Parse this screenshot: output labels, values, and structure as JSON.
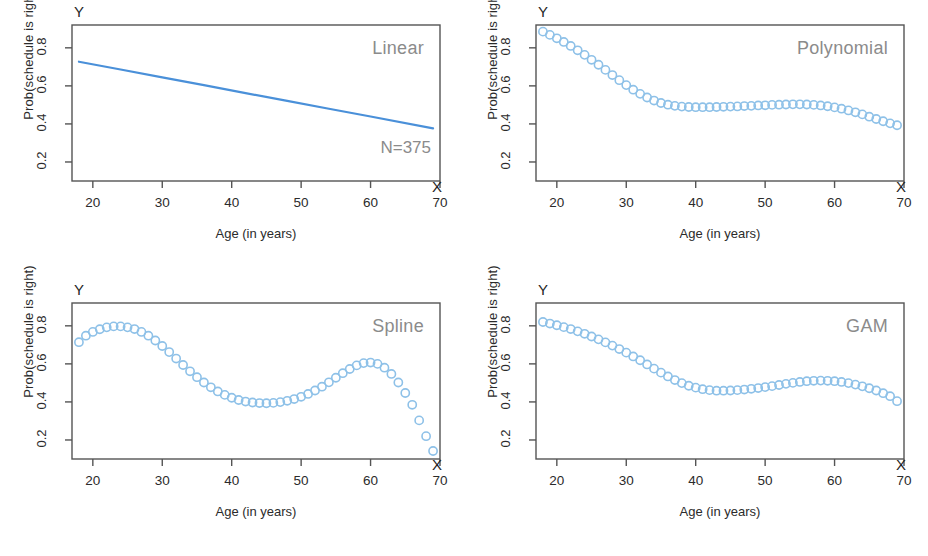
{
  "figure": {
    "background": "#ffffff",
    "marker_color": "#8ec1e8",
    "line_color": "#4a90d9",
    "axis_color": "#545454",
    "title_color": "#8b8b8b",
    "panel_count": 4
  },
  "axes": {
    "y_axis_title": "Prob(schedule is right)",
    "x_axis_title": "Age (in years)",
    "y_ticks": [
      "0.2",
      "0.4",
      "0.6",
      "0.8"
    ],
    "x_ticks": [
      "20",
      "30",
      "40",
      "50",
      "60",
      "70"
    ],
    "y_marker": "Y",
    "x_marker": "X"
  },
  "chart_data": [
    {
      "type": "line",
      "title": "Linear",
      "xlabel": "Age (in years)",
      "ylabel": "Prob(schedule is right)",
      "xlim": [
        17,
        70
      ],
      "ylim": [
        0.1,
        0.92
      ],
      "xticks": [
        20,
        30,
        40,
        50,
        60,
        70
      ],
      "yticks": [
        0.2,
        0.4,
        0.6,
        0.8
      ],
      "grid": false,
      "legend": "none",
      "annotation": "N=375",
      "n": 375,
      "x": [
        18,
        24,
        30,
        36,
        42,
        48,
        54,
        60,
        69
      ],
      "y": [
        0.727,
        0.686,
        0.645,
        0.604,
        0.562,
        0.521,
        0.48,
        0.439,
        0.377
      ]
    },
    {
      "type": "scatter",
      "title": "Polynomial",
      "xlabel": "Age (in years)",
      "ylabel": "Prob(schedule is right)",
      "xlim": [
        17,
        70
      ],
      "ylim": [
        0.1,
        0.92
      ],
      "xticks": [
        20,
        30,
        40,
        50,
        60,
        70
      ],
      "yticks": [
        0.2,
        0.4,
        0.6,
        0.8
      ],
      "grid": false,
      "legend": "none",
      "x": [
        18,
        19,
        20,
        21,
        22,
        23,
        24,
        25,
        26,
        27,
        28,
        29,
        30,
        31,
        32,
        33,
        34,
        35,
        36,
        37,
        38,
        39,
        40,
        41,
        42,
        43,
        44,
        45,
        46,
        47,
        48,
        49,
        50,
        51,
        52,
        53,
        54,
        55,
        56,
        57,
        58,
        59,
        60,
        61,
        62,
        63,
        64,
        65,
        66,
        67,
        68,
        69
      ],
      "y": [
        0.885,
        0.868,
        0.85,
        0.831,
        0.81,
        0.787,
        0.763,
        0.737,
        0.711,
        0.684,
        0.657,
        0.63,
        0.604,
        0.58,
        0.558,
        0.539,
        0.523,
        0.51,
        0.501,
        0.495,
        0.491,
        0.489,
        0.488,
        0.488,
        0.488,
        0.489,
        0.49,
        0.491,
        0.492,
        0.494,
        0.495,
        0.497,
        0.498,
        0.5,
        0.501,
        0.502,
        0.503,
        0.503,
        0.502,
        0.5,
        0.497,
        0.493,
        0.487,
        0.48,
        0.471,
        0.461,
        0.45,
        0.438,
        0.426,
        0.414,
        0.403,
        0.393
      ]
    },
    {
      "type": "scatter",
      "title": "Spline",
      "xlabel": "Age (in years)",
      "ylabel": "Prob(schedule is right)",
      "xlim": [
        17,
        70
      ],
      "ylim": [
        0.1,
        0.92
      ],
      "xticks": [
        20,
        30,
        40,
        50,
        60,
        70
      ],
      "yticks": [
        0.2,
        0.4,
        0.6,
        0.8
      ],
      "grid": false,
      "legend": "none",
      "x": [
        18,
        19,
        20,
        21,
        22,
        23,
        24,
        25,
        26,
        27,
        28,
        29,
        30,
        31,
        32,
        33,
        34,
        35,
        36,
        37,
        38,
        39,
        40,
        41,
        42,
        43,
        44,
        45,
        46,
        47,
        48,
        49,
        50,
        51,
        52,
        53,
        54,
        55,
        56,
        57,
        58,
        59,
        60,
        61,
        62,
        63,
        64,
        65,
        66,
        67,
        68,
        69
      ],
      "y": [
        0.714,
        0.748,
        0.768,
        0.782,
        0.792,
        0.797,
        0.797,
        0.792,
        0.783,
        0.768,
        0.748,
        0.723,
        0.694,
        0.662,
        0.628,
        0.594,
        0.561,
        0.53,
        0.502,
        0.477,
        0.455,
        0.437,
        0.422,
        0.41,
        0.402,
        0.397,
        0.394,
        0.393,
        0.395,
        0.399,
        0.406,
        0.415,
        0.427,
        0.442,
        0.46,
        0.48,
        0.503,
        0.527,
        0.551,
        0.573,
        0.592,
        0.604,
        0.607,
        0.6,
        0.58,
        0.547,
        0.502,
        0.447,
        0.385,
        0.303,
        0.22,
        0.142
      ]
    },
    {
      "type": "scatter",
      "title": "GAM",
      "xlabel": "Age (in years)",
      "ylabel": "Prob(schedule is right)",
      "xlim": [
        17,
        70
      ],
      "ylim": [
        0.1,
        0.92
      ],
      "xticks": [
        20,
        30,
        40,
        50,
        60,
        70
      ],
      "yticks": [
        0.2,
        0.4,
        0.6,
        0.8
      ],
      "grid": false,
      "legend": "none",
      "x": [
        18,
        19,
        20,
        21,
        22,
        23,
        24,
        25,
        26,
        27,
        28,
        29,
        30,
        31,
        32,
        33,
        34,
        35,
        36,
        37,
        38,
        39,
        40,
        41,
        42,
        43,
        44,
        45,
        46,
        47,
        48,
        49,
        50,
        51,
        52,
        53,
        54,
        55,
        56,
        57,
        58,
        59,
        60,
        61,
        62,
        63,
        64,
        65,
        66,
        67,
        68,
        69
      ],
      "y": [
        0.82,
        0.812,
        0.803,
        0.793,
        0.783,
        0.771,
        0.758,
        0.744,
        0.729,
        0.713,
        0.696,
        0.678,
        0.659,
        0.639,
        0.619,
        0.597,
        0.575,
        0.554,
        0.534,
        0.515,
        0.499,
        0.485,
        0.475,
        0.467,
        0.462,
        0.459,
        0.459,
        0.46,
        0.462,
        0.465,
        0.469,
        0.473,
        0.478,
        0.483,
        0.489,
        0.495,
        0.5,
        0.505,
        0.509,
        0.511,
        0.512,
        0.511,
        0.509,
        0.505,
        0.499,
        0.491,
        0.482,
        0.472,
        0.46,
        0.446,
        0.43,
        0.404
      ]
    }
  ]
}
